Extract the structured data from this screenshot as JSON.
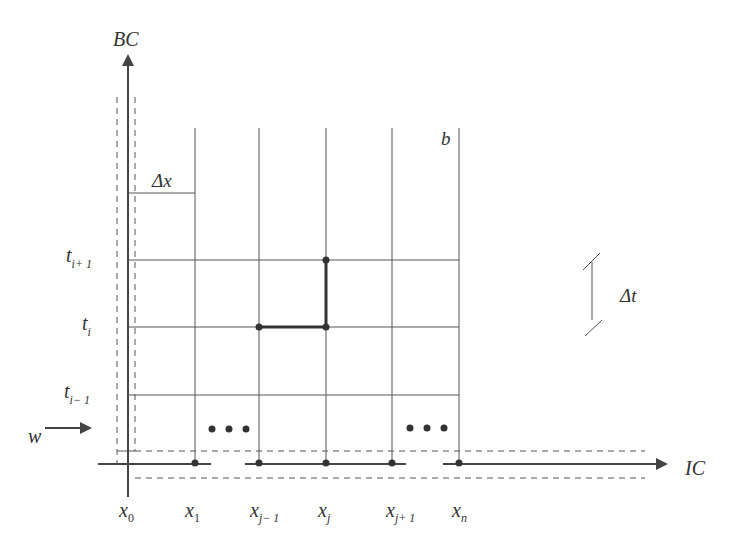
{
  "diagram": {
    "type": "finite-difference-grid",
    "axes": {
      "vertical_label": "BC",
      "horizontal_label": "IC"
    },
    "x_labels": [
      {
        "base": "x",
        "sub": "0"
      },
      {
        "base": "x",
        "sub": "1"
      },
      {
        "base": "x",
        "sub": "j− 1"
      },
      {
        "base": "x",
        "sub": "j"
      },
      {
        "base": "x",
        "sub": "j+ 1"
      },
      {
        "base": "x",
        "sub": "n"
      }
    ],
    "t_labels": [
      {
        "base": "t",
        "sub": "i+ 1"
      },
      {
        "base": "t",
        "sub": "i"
      },
      {
        "base": "t",
        "sub": "i− 1"
      }
    ],
    "annotations": {
      "delta_x": "Δx",
      "delta_t": "Δt",
      "boundary": "b",
      "inflow": "w",
      "ellipsis_left": "• • •",
      "ellipsis_right": "• • •"
    },
    "colors": {
      "line": "#555555",
      "stencil": "#333333",
      "background": "#ffffff"
    }
  }
}
